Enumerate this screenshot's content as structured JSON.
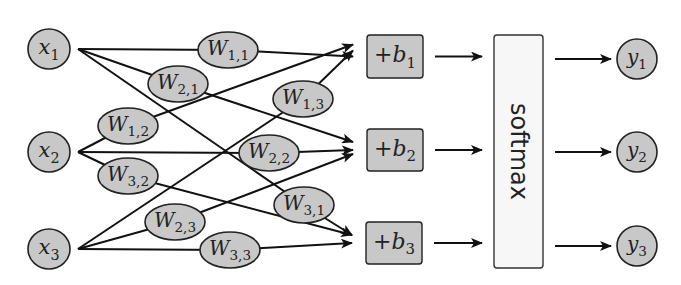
{
  "diagram": {
    "title": "",
    "inputs": [
      {
        "id": "x1",
        "base": "x",
        "sub": "1",
        "cx": 49,
        "cy": 49
      },
      {
        "id": "x2",
        "base": "x",
        "sub": "2",
        "cx": 49,
        "cy": 152
      },
      {
        "id": "x3",
        "base": "x",
        "sub": "3",
        "cx": 49,
        "cy": 249
      }
    ],
    "weights": [
      {
        "id": "W11",
        "base": "W",
        "sub": "1,1",
        "cx": 228,
        "cy": 50,
        "from": "x1",
        "to": "b1"
      },
      {
        "id": "W21",
        "base": "W",
        "sub": "2,1",
        "cx": 178,
        "cy": 84,
        "from": "x1",
        "to": "b2"
      },
      {
        "id": "W31",
        "base": "W",
        "sub": "3,1",
        "cx": 304,
        "cy": 205,
        "from": "x1",
        "to": "b3"
      },
      {
        "id": "W12",
        "base": "W",
        "sub": "1,2",
        "cx": 128,
        "cy": 126,
        "from": "x2",
        "to": "b1"
      },
      {
        "id": "W22",
        "base": "W",
        "sub": "2,2",
        "cx": 269,
        "cy": 153,
        "from": "x2",
        "to": "b2"
      },
      {
        "id": "W32",
        "base": "W",
        "sub": "3,2",
        "cx": 128,
        "cy": 176,
        "from": "x2",
        "to": "b3"
      },
      {
        "id": "W13",
        "base": "W",
        "sub": "1,3",
        "cx": 303,
        "cy": 99,
        "from": "x3",
        "to": "b1"
      },
      {
        "id": "W23",
        "base": "W",
        "sub": "2,3",
        "cx": 175,
        "cy": 222,
        "from": "x3",
        "to": "b2"
      },
      {
        "id": "W33",
        "base": "W",
        "sub": "3,3",
        "cx": 230,
        "cy": 250,
        "from": "x3",
        "to": "b3"
      }
    ],
    "biases": [
      {
        "id": "b1",
        "prefix": "+",
        "base": "b",
        "sub": "1",
        "x": 367,
        "y": 35,
        "w": 56,
        "h": 43
      },
      {
        "id": "b2",
        "prefix": "+",
        "base": "b",
        "sub": "2",
        "x": 367,
        "y": 129,
        "w": 56,
        "h": 42
      },
      {
        "id": "b3",
        "prefix": "+",
        "base": "b",
        "sub": "3",
        "x": 366,
        "y": 222,
        "w": 56,
        "h": 42
      }
    ],
    "softmax": {
      "label": "softmax",
      "x": 494,
      "y": 35,
      "w": 49,
      "h": 233
    },
    "outputs": [
      {
        "id": "y1",
        "base": "y",
        "sub": "1",
        "cx": 637,
        "cy": 59
      },
      {
        "id": "y2",
        "base": "y",
        "sub": "2",
        "cx": 637,
        "cy": 152
      },
      {
        "id": "y3",
        "base": "y",
        "sub": "3",
        "cx": 637,
        "cy": 246
      }
    ],
    "colors": {
      "node_fill": "#c8c8c8",
      "softmax_fill": "#f7f7f7",
      "stroke": "#222222"
    }
  }
}
